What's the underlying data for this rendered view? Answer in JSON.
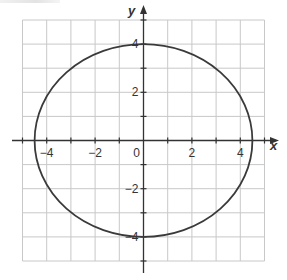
{
  "graph": {
    "x_axis_label": "x",
    "y_axis_label": "y",
    "x_range": [
      -5,
      5
    ],
    "y_range": [
      -5,
      5
    ],
    "grid_step": 1,
    "x_tick_labels": [
      {
        "value": -4,
        "label": "−4"
      },
      {
        "value": -2,
        "label": "−2"
      },
      {
        "value": 0,
        "label": "0"
      },
      {
        "value": 2,
        "label": "2"
      },
      {
        "value": 4,
        "label": "4"
      }
    ],
    "y_tick_labels": [
      {
        "value": 4,
        "label": "4"
      },
      {
        "value": 2,
        "label": "2"
      },
      {
        "value": -2,
        "label": "−2"
      },
      {
        "value": -4,
        "label": "−4"
      }
    ],
    "curve": {
      "type": "ellipse",
      "center": [
        0,
        0
      ],
      "semi_axis_x": 4.5,
      "semi_axis_y": 4
    },
    "colors": {
      "grid": "#c8c8c8",
      "axis": "#333333",
      "curve": "#3a3a3a"
    }
  }
}
